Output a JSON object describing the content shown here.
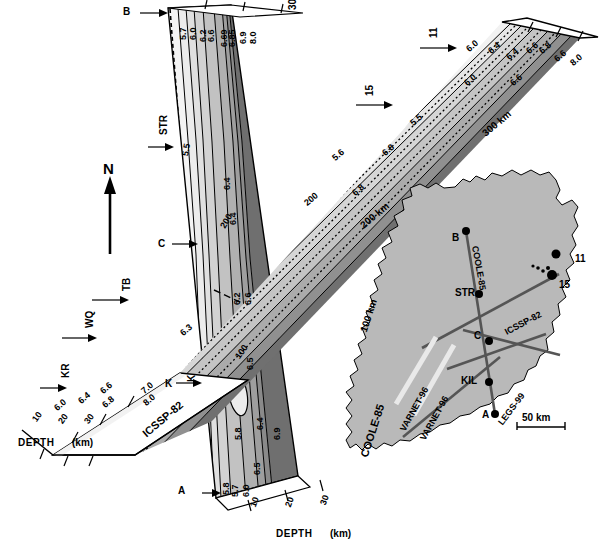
{
  "figure": {
    "type": "3d-block-diagram",
    "north_arrow_label": "N"
  },
  "sections": {
    "coole": {
      "name": "COOLE-85",
      "label_top_right": "300 km",
      "label_bottom_right": "100 km",
      "depth_axis_label": "DEPTH",
      "depth_axis_unit": "(km)",
      "depth_ticks": [
        "10",
        "20",
        "30"
      ],
      "end_markers": [
        {
          "label": "B",
          "position": "top"
        },
        {
          "label": "A",
          "position": "bottom"
        }
      ],
      "station_markers": [
        {
          "label": "STR"
        },
        {
          "label": "C"
        },
        {
          "label": "K"
        }
      ],
      "contour_labels_top": [
        "5.7",
        "6.0",
        "6.2",
        "6.6",
        "6.69",
        "6.85",
        "6.9",
        "8.0"
      ],
      "contour_labels_interior": [
        "5.5",
        "6.4",
        "6.4",
        "6.2",
        "6.6",
        "6.5",
        "5.8"
      ],
      "contour_labels_bottom": [
        "5.8",
        "5.7",
        "6.0",
        "6.5",
        "6.4",
        "6.9"
      ],
      "distance_tick_labels": [
        "100",
        "200"
      ]
    },
    "icssp": {
      "name": "ICSSP-82",
      "label_far_right": "300 km",
      "label_mid_right": "200 km",
      "depth_axis_label": "DEPTH",
      "depth_axis_unit": "(km)",
      "depth_ticks": [
        "10",
        "20",
        "30"
      ],
      "station_markers": [
        {
          "label": "KR"
        },
        {
          "label": "WQ"
        },
        {
          "label": "TB"
        },
        {
          "label": "K"
        },
        {
          "label": "11"
        },
        {
          "label": "15"
        }
      ],
      "contour_labels_left": [
        "6.0",
        "6.4",
        "6.6",
        "6.8",
        "7.0",
        "8.0"
      ],
      "contour_labels_right": [
        "6.0",
        "6.4",
        "6.4",
        "6.6",
        "6.8",
        "6.6",
        "8.0"
      ],
      "contour_labels_interior": [
        "6.3",
        "5.5",
        "5.6",
        "6.0",
        "6.6",
        "6.8",
        "6.8"
      ],
      "distance_tick_labels": [
        "200"
      ]
    }
  },
  "inset_map": {
    "title": "Ireland location map",
    "scale_bar": "50 km",
    "profile_lines": [
      "COOLE-85",
      "ICSSP-82",
      "VARNET-96",
      "VARNET-96",
      "LEGS-99"
    ],
    "stations": [
      {
        "label": "B"
      },
      {
        "label": "STR"
      },
      {
        "label": "C"
      },
      {
        "label": "KIL"
      },
      {
        "label": "A"
      },
      {
        "label": "11"
      },
      {
        "label": "15"
      }
    ]
  },
  "velocity_scale": {
    "unit": "km/s",
    "values": [
      5.5,
      5.6,
      5.7,
      5.8,
      6.0,
      6.2,
      6.3,
      6.4,
      6.5,
      6.6,
      6.69,
      6.8,
      6.85,
      6.9,
      7.0,
      8.0
    ]
  },
  "colors": {
    "band_1": "#f2f2f2",
    "band_2": "#e2e2e2",
    "band_3": "#d0d0d0",
    "band_4": "#bdbdbd",
    "band_5": "#a8a8a8",
    "band_6": "#949494",
    "band_7": "#7d7d7d",
    "band_8": "#666666",
    "land": "#b8b8b8",
    "line": "#000000"
  }
}
